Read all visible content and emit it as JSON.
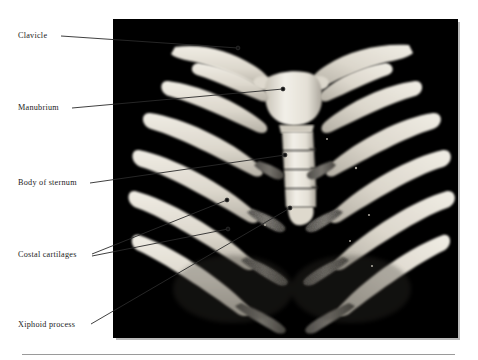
{
  "page": {
    "background_color": "#ffffff",
    "width": 478,
    "height": 360
  },
  "figure": {
    "kind": "radiograph-photograph",
    "plate_background_color": "#000000",
    "bone_color": "#e8e4db",
    "cartilage_color": "#6f6d68",
    "frame": {
      "x": 113,
      "y": 19,
      "width": 345,
      "height": 319
    }
  },
  "labels": [
    {
      "id": "clavicle",
      "text": "Clavicle",
      "text_x": 18,
      "text_y": 31,
      "leader": {
        "x1": 61,
        "y1": 36,
        "x2": 238,
        "y2": 48
      },
      "dot": {
        "x": 238,
        "y": 48
      }
    },
    {
      "id": "manubrium",
      "text": "Manubrium",
      "text_x": 18,
      "text_y": 103,
      "leader": {
        "x1": 72,
        "y1": 108,
        "x2": 283,
        "y2": 89
      },
      "dot": {
        "x": 283,
        "y": 89
      }
    },
    {
      "id": "body-of-sternum",
      "text": "Body of sternum",
      "text_x": 18,
      "text_y": 178,
      "leader": {
        "x1": 90,
        "y1": 183,
        "x2": 285,
        "y2": 155
      },
      "dot": {
        "x": 285,
        "y": 155
      }
    },
    {
      "id": "costal-cartilages-upper",
      "text": "Costal cartilages",
      "text_x": 18,
      "text_y": 250,
      "leader": {
        "x1": 92,
        "y1": 254,
        "x2": 227,
        "y2": 200
      },
      "dot": {
        "x": 227,
        "y": 200
      }
    },
    {
      "id": "costal-cartilages-lower",
      "text": "",
      "leader": {
        "x1": 92,
        "y1": 256,
        "x2": 228,
        "y2": 229
      },
      "dot": {
        "x": 228,
        "y": 229
      }
    },
    {
      "id": "xiphoid-process",
      "text": "Xiphoid process",
      "text_x": 18,
      "text_y": 320,
      "leader": {
        "x1": 91,
        "y1": 324,
        "x2": 290,
        "y2": 208
      },
      "dot": {
        "x": 290,
        "y": 208
      }
    }
  ],
  "footer": {
    "rule_color": "#9a9a9a",
    "rule_x": 22,
    "rule_y": 354,
    "rule_width": 433
  },
  "colors": {
    "leader_line": "#2a2a2a",
    "label_text": "#1b1b1b",
    "plate_shadow": "#b9b9b9"
  }
}
